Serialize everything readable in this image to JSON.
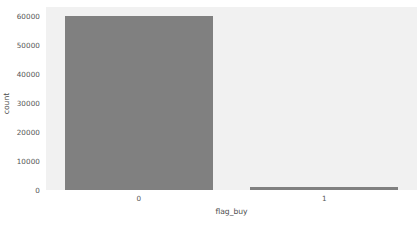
{
  "chart_data": {
    "type": "bar",
    "title": "",
    "xlabel": "flag_buy",
    "ylabel": "count",
    "categories": [
      "0",
      "1"
    ],
    "values": [
      59900,
      1200
    ],
    "ylim": [
      0,
      63000
    ],
    "yticks": [
      0,
      10000,
      20000,
      30000,
      40000,
      50000,
      60000
    ],
    "ytick_labels": [
      "0",
      "10000",
      "20000",
      "30000",
      "40000",
      "50000",
      "60000"
    ],
    "xtick_labels": [
      "0",
      "1"
    ],
    "grid": false,
    "legend": null,
    "bar_color": "#808080",
    "plot_background": "#f1f1f1",
    "figure_background": "#ffffff",
    "tick_label_color": "#555555",
    "axis_label_color": "#4d4d4d"
  }
}
